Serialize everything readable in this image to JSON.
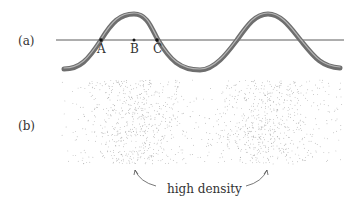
{
  "panels": {
    "a": {
      "label": "(a)"
    },
    "b": {
      "label": "(b)"
    }
  },
  "points": [
    {
      "name": "A",
      "x": 101,
      "y": 40
    },
    {
      "name": "B",
      "x": 134,
      "y": 40
    },
    {
      "name": "C",
      "x": 157,
      "y": 40
    }
  ],
  "annotation": {
    "text": "high density"
  },
  "colors": {
    "wave": "#6e6e6e",
    "axis": "#333333",
    "dots": "#9a9a9a"
  }
}
